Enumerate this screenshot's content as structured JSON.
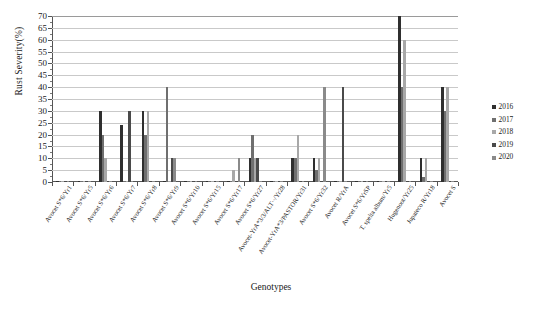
{
  "chart_data": {
    "type": "bar",
    "title": "",
    "xlabel": "Genotypes",
    "ylabel": "Rust Severity(%)",
    "ylim": [
      0,
      70
    ],
    "ytick_step": 5,
    "yticks": [
      0,
      5,
      10,
      15,
      20,
      25,
      30,
      35,
      40,
      45,
      50,
      55,
      60,
      65,
      70
    ],
    "grid": true,
    "legend_position": "right",
    "categories": [
      "Avocet S*6/Yr1",
      "Avocet S*6/Yr5",
      "Avocet S*6/Yr6",
      "Avocet S*6/Yr7",
      "Avocet S*6/Yr8",
      "Avocet S*6/Yr9",
      "Avocet S*6/Yr10",
      "Avocet S*6/Yr15",
      "Avocet S*6/Yr17",
      "Avocet S*6/Yr27",
      "Avocet-YrA*3/3/ALT··/Yr28",
      "Avocet-YrA*3/PASTOR/Yr31",
      "Avocet S*6/Yr32",
      "Avocet R/YrA",
      "Avocet S*6/YrSP",
      "T. spelta album/Yr5",
      "Hugenoot/Yr25",
      "Jupateco R/Yr18",
      "Avocet S"
    ],
    "series": [
      {
        "name": "2016",
        "color": "#2f2f2f",
        "values": [
          0.6,
          0.6,
          30,
          24,
          30,
          0.6,
          0.6,
          0.6,
          0.6,
          10,
          0.6,
          10,
          10,
          0.6,
          0.6,
          0.6,
          70,
          10,
          40
        ]
      },
      {
        "name": "2017",
        "color": "#6f6f6f",
        "values": [
          0.6,
          0.6,
          20,
          0.6,
          20,
          40,
          0.6,
          0.6,
          0.6,
          20,
          0.6,
          10,
          5,
          0.6,
          0.6,
          0.6,
          40,
          2,
          30
        ]
      },
      {
        "name": "2018",
        "color": "#a8a8a8",
        "values": [
          0.6,
          0.6,
          10,
          0.6,
          30,
          0.6,
          0.6,
          0.6,
          5,
          10,
          0.6,
          20,
          10,
          0.6,
          0.6,
          0.6,
          60,
          10,
          40
        ]
      },
      {
        "name": "2019",
        "color": "#4a4a4a",
        "values": [
          0.6,
          0.6,
          0.6,
          30,
          0.6,
          10,
          0.6,
          0.6,
          0.6,
          10,
          0.6,
          0.6,
          0.6,
          40,
          0.6,
          0.6,
          0.6,
          0.6,
          0.6
        ]
      },
      {
        "name": "2020",
        "color": "#8a8a8a",
        "values": [
          0.6,
          0.6,
          0.6,
          0.6,
          0.6,
          10,
          0.6,
          0.6,
          10,
          0.6,
          0.6,
          0.6,
          40,
          0.6,
          0.6,
          0.6,
          0.6,
          0.6,
          0.6
        ]
      }
    ],
    "legend": [
      "2016",
      "2017",
      "2018",
      "2019",
      "2020"
    ]
  },
  "caption": ""
}
